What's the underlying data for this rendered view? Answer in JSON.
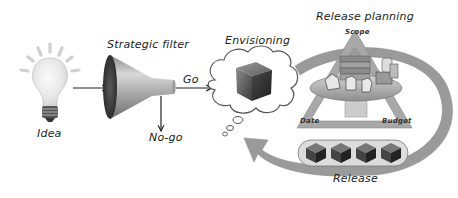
{
  "diagram": {
    "nodes": {
      "idea": {
        "label": "Idea",
        "icon": "lightbulb-icon"
      },
      "strategic_filter": {
        "label": "Strategic filter",
        "icon": "funnel-icon"
      },
      "envisioning": {
        "label": "Envisioning",
        "icon": "thought-cloud-cube-icon"
      },
      "release_planning": {
        "label": "Release planning",
        "icon": "planning-table-icon"
      },
      "release": {
        "label": "Release",
        "icon": "cube-stack-icon",
        "cube_count": 4
      }
    },
    "edges": {
      "go": "Go",
      "no_go": "No-go"
    },
    "triangle": {
      "scope": "Scope",
      "date": "Date",
      "budget": "Budget"
    },
    "colors": {
      "background": "#ffffff",
      "arrow_fill": "#9a9a9a",
      "triangle_fill": "#a8a8a8",
      "cube_dark": "#333333",
      "cube_light": "#7a7a7a",
      "text": "#222222"
    }
  }
}
